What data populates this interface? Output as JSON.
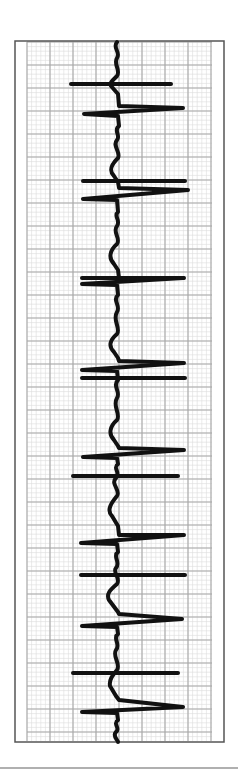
{
  "figure": {
    "orientation": "vertical",
    "frame": {
      "x": 15,
      "y": 41,
      "width": 209,
      "height": 701,
      "stroke": "#555555"
    },
    "grid": {
      "x": 27,
      "y": 42,
      "width": 185,
      "height": 699,
      "major_spacing": 23,
      "minor_spacing": 4.6,
      "major_color": "#a8a8a8",
      "minor_color": "#dcdcdc"
    },
    "trace": {
      "color": "#111111",
      "stroke_width": 4,
      "path": "M117,42 C112,48 121,52 117,58 C113,64 121,70 117,76 C113,80 109,83 111,86 L118,94 L119,106 L183,108 L84,114 L118,116 L119,126 C113,130 121,136 117,140 C112,146 121,152 118,158 C112,164 108,170 114,176 L118,182 L119,188 L188,190 L83,199 L117,200 L118,212 C113,216 121,220 117,226 C112,232 121,238 117,244 C110,250 108,258 114,264 L118,270 L119,278 L183,278 L82,284 L117,285 L118,295 C112,300 121,306 117,312 C112,320 121,328 117,334 C110,340 108,346 114,352 L118,358 L119,361 L184,363 L82,370 L117,371 L118,380 C112,386 121,392 117,398 C112,406 121,414 117,420 C110,426 108,434 114,440 L118,446 L119,448 L184,450 L83,457 L117,458 L118,464 C112,468 121,472 116,478 C110,484 121,490 117,496 C112,502 106,510 112,516 L118,526 L119,535 L184,535 L81,543 L117,544 L118,552 C112,556 121,562 116,568 C112,572 121,578 117,584 C110,590 106,594 109,600 L118,612 L119,614 L182,619 L82,626 L117,627 L118,634 C112,638 121,644 116,650 C112,656 121,664 117,670 C112,676 109,680 110,686 L116,696 L119,700 L183,707 L82,712 L117,713 L118,720 C112,724 121,728 116,732 C112,736 118,740 118,742"
    },
    "horizontal_marks": [
      {
        "y": 84,
        "x1": 71,
        "x2": 171
      },
      {
        "y": 181,
        "x1": 83,
        "x2": 185
      },
      {
        "y": 278,
        "x1": 82,
        "x2": 184
      },
      {
        "y": 378,
        "x1": 82,
        "x2": 185
      },
      {
        "y": 476,
        "x1": 73,
        "x2": 178
      },
      {
        "y": 575,
        "x1": 81,
        "x2": 185
      },
      {
        "y": 673,
        "x1": 73,
        "x2": 178
      }
    ],
    "separator": {
      "y": 768,
      "x1": 0,
      "x2": 238,
      "color": "#b0b0b0"
    }
  }
}
